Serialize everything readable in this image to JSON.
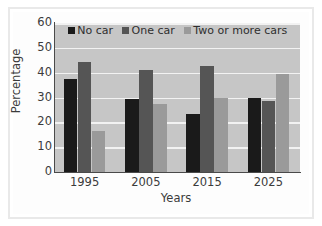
{
  "chart_data": {
    "type": "bar",
    "title": "",
    "xlabel": "Years",
    "ylabel": "Percentage",
    "categories": [
      "1995",
      "2005",
      "2015",
      "2025"
    ],
    "series": [
      {
        "name": "No car",
        "color": "#1a1a1a",
        "values": [
          37.5,
          29.5,
          23.5,
          30
        ]
      },
      {
        "name": "One car",
        "color": "#555555",
        "values": [
          44.5,
          41,
          42.5,
          28.5
        ]
      },
      {
        "name": "Two or more cars",
        "color": "#9a9a9a",
        "values": [
          16.5,
          27.5,
          30,
          39.5
        ]
      }
    ],
    "ylim": [
      0,
      60
    ],
    "ytick_values": [
      0,
      10,
      20,
      30,
      40,
      50,
      60
    ],
    "ytick_labels": [
      "0",
      "10",
      "20",
      "30",
      "40",
      "50",
      "60"
    ],
    "grid": true,
    "grid_axis": "y",
    "legend_position": "top-center",
    "plot_background": "#c6c6c6",
    "gridline_color": "#f2f2f2",
    "axis_color": "#4a4a4a",
    "figure_background": "#ffffff"
  }
}
